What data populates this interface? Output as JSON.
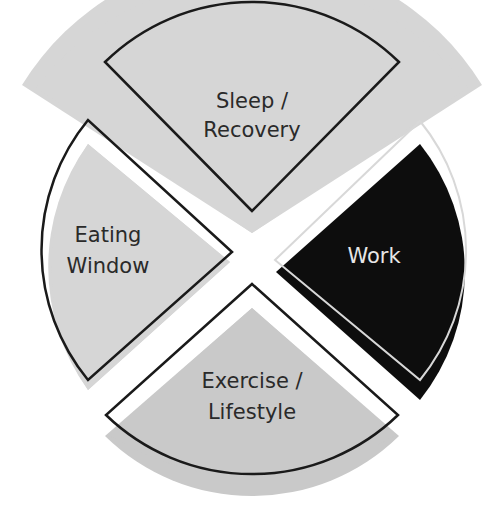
{
  "diagram": {
    "type": "quadrant-circle",
    "colors": {
      "gray_fill": "#d4d4d4",
      "gray_fill_dark": "#c8c8c8",
      "outline": "#1a1a1a",
      "black_fill": "#0d0d0d",
      "white_outline": "#d8d8d8",
      "text_dark": "#2a2a2a",
      "text_light": "#e6e6e6"
    },
    "sectors": [
      {
        "id": "top",
        "line1": "Sleep /",
        "line2": "Recovery"
      },
      {
        "id": "left",
        "line1": "Eating",
        "line2": "Window"
      },
      {
        "id": "right",
        "line1": "Work",
        "line2": ""
      },
      {
        "id": "bottom",
        "line1": "Exercise /",
        "line2": "Lifestyle"
      }
    ]
  }
}
